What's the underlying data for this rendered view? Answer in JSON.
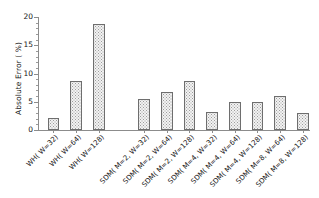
{
  "chart_data": {
    "type": "bar",
    "title": "",
    "subtitle": "",
    "xlabel": "",
    "ylabel": "Absolute Error ( %)",
    "ylim": [
      0,
      20
    ],
    "yticks": [
      0,
      5,
      10,
      15,
      20
    ],
    "ytick_labels": [
      "0",
      "5",
      "10",
      "15",
      "20"
    ],
    "yminor_ticks": [
      1,
      2,
      3,
      4,
      6,
      7,
      8,
      9,
      11,
      12,
      13,
      14,
      16,
      17,
      18,
      19
    ],
    "grid": false,
    "legend": "none",
    "bar_fill": "dotted-hatch",
    "bar_edge_color": "#6e6e6e",
    "bar_face_color": "#f2f2f2",
    "axis_color": "#8c8c8c",
    "categories": [
      "WH( W=32)",
      "WH( W=64)",
      "WH( W=128)",
      "SDM( M=2, W=32)",
      "SDM( M=2, W=64)",
      "SDM( M=2, W=128)",
      "SDM( M=4, W=32)",
      "SDM( M=4, W=64)",
      "SDM( M=4, W=128)",
      "SDM( M=8, W=64)",
      "SDM( M=8, W=128)"
    ],
    "values": [
      2.1,
      8.7,
      18.7,
      5.5,
      6.7,
      8.7,
      3.2,
      4.9,
      4.9,
      6.0,
      3.1
    ],
    "gap_after_index": 2
  }
}
